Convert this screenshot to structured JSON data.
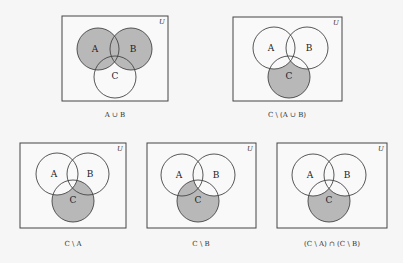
{
  "figure": {
    "background": "#f6f6f6",
    "shade_color": "#b8b8b8",
    "line_color": "#444444",
    "universe_label": "U",
    "set_labels": {
      "A": "A",
      "B": "B",
      "C": "C"
    }
  },
  "diagrams": [
    {
      "id": "a-union-b",
      "caption": "A ∪ B",
      "box": {
        "x": 62,
        "y": 16,
        "w": 106,
        "h": 85
      },
      "circles": {
        "A": [
          98,
          49
        ],
        "B": [
          131,
          49
        ],
        "C": [
          115,
          77
        ]
      },
      "r": 21,
      "shaded": "A∪B",
      "caption_pos": [
        115,
        116
      ]
    },
    {
      "id": "c-minus-a-union-b",
      "caption": "C \\ (A ∪ B)",
      "box": {
        "x": 233,
        "y": 17,
        "w": 109,
        "h": 84
      },
      "circles": {
        "A": [
          274,
          48
        ],
        "B": [
          307,
          48
        ],
        "C": [
          289,
          77
        ]
      },
      "r": 21,
      "shaded": "C\\(A∪B)",
      "caption_pos": [
        287,
        116
      ]
    },
    {
      "id": "c-minus-a",
      "caption": "C \\ A",
      "box": {
        "x": 20,
        "y": 143,
        "w": 106,
        "h": 85
      },
      "circles": {
        "A": [
          57,
          174
        ],
        "B": [
          88,
          174
        ],
        "C": [
          73,
          201
        ]
      },
      "r": 21,
      "shaded": "C\\A",
      "caption_pos": [
        73,
        245
      ]
    },
    {
      "id": "c-minus-b",
      "caption": "C \\ B",
      "box": {
        "x": 147,
        "y": 143,
        "w": 109,
        "h": 85
      },
      "circles": {
        "A": [
          182,
          175
        ],
        "B": [
          214,
          175
        ],
        "C": [
          198,
          201
        ]
      },
      "r": 21,
      "shaded": "C\\B",
      "caption_pos": [
        201,
        245
      ]
    },
    {
      "id": "c-minus-a-intersect-c-minus-b",
      "caption": "(C \\ A) ∩ (C \\ B)",
      "box": {
        "x": 277,
        "y": 143,
        "w": 110,
        "h": 85
      },
      "circles": {
        "A": [
          313,
          175
        ],
        "B": [
          345,
          175
        ],
        "C": [
          329,
          201
        ]
      },
      "r": 21,
      "shaded": "C\\(A∪B)",
      "caption_pos": [
        332,
        245
      ]
    }
  ]
}
